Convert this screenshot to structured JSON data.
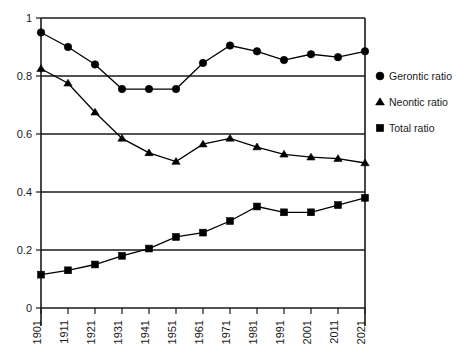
{
  "chart_data": {
    "type": "line",
    "title": "",
    "xlabel": "",
    "ylabel": "",
    "categories": [
      "1901",
      "1911",
      "1921",
      "1931",
      "1941",
      "1951",
      "1961",
      "1971",
      "1981",
      "1991",
      "2001",
      "2011",
      "2021"
    ],
    "x_tick_labels": [
      "1901",
      "1911",
      "1921",
      "1931",
      "1941",
      "1951",
      "1961",
      "1971",
      "1981",
      "1991",
      "2001",
      "2011",
      "2021"
    ],
    "y_tick_labels": [
      "0",
      "0.2",
      "0.4",
      "0.6",
      "0.8",
      "1"
    ],
    "y_tick_values": [
      0,
      0.2,
      0.4,
      0.6,
      0.8,
      1
    ],
    "ylim": [
      0,
      1
    ],
    "grid": "horizontal",
    "legend_position": "right",
    "series": [
      {
        "name": "Gerontic ratio",
        "marker": "circle",
        "color": "#000000",
        "values": [
          0.95,
          0.9,
          0.84,
          0.755,
          0.755,
          0.755,
          0.845,
          0.905,
          0.885,
          0.855,
          0.875,
          0.865,
          0.885
        ]
      },
      {
        "name": "Neontic ratio",
        "marker": "triangle",
        "color": "#000000",
        "values": [
          0.825,
          0.775,
          0.675,
          0.585,
          0.535,
          0.505,
          0.565,
          0.585,
          0.555,
          0.53,
          0.52,
          0.515,
          0.5
        ]
      },
      {
        "name": "Total ratio",
        "marker": "square",
        "color": "#000000",
        "values": [
          0.115,
          0.13,
          0.15,
          0.18,
          0.205,
          0.245,
          0.26,
          0.3,
          0.35,
          0.33,
          0.33,
          0.355,
          0.38
        ]
      }
    ]
  },
  "legend": {
    "items": [
      {
        "label": "Gerontic ratio",
        "marker": "circle"
      },
      {
        "label": "Neontic ratio",
        "marker": "triangle"
      },
      {
        "label": "Total ratio",
        "marker": "square"
      }
    ]
  }
}
